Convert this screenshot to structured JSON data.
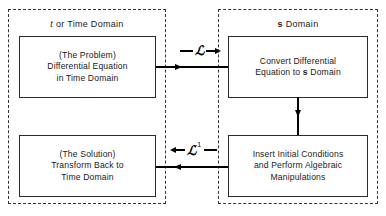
{
  "diagram": {
    "regions": [
      {
        "id": "time-domain",
        "label_prefix": "t",
        "label_rest": " or Time Domain"
      },
      {
        "id": "s-domain",
        "label_prefix": "s",
        "label_rest": " Domain"
      }
    ],
    "boxes": [
      {
        "id": "problem",
        "text": "(The Problem)\nDifferential Equation\nin Time Domain"
      },
      {
        "id": "convert",
        "line1": "Convert Differential",
        "line2_pre": "Equation to ",
        "line2_sym": "s",
        "line2_post": " Domain"
      },
      {
        "id": "solution",
        "text": "(The Solution)\nTransform Back to\nTime Domain"
      },
      {
        "id": "insert",
        "text": "Insert Initial Conditions\nand Perform Algebraic\nManipulations"
      }
    ],
    "operators": [
      {
        "id": "laplace-forward",
        "symbol": "ℒ",
        "superscript": "",
        "direction": "right"
      },
      {
        "id": "laplace-inverse",
        "symbol": "ℒ",
        "superscript": "-1",
        "direction": "left"
      }
    ],
    "connectors": [
      {
        "id": "forward-flow",
        "direction": "right"
      },
      {
        "id": "downward-flow",
        "direction": "down"
      },
      {
        "id": "return-flow",
        "direction": "left"
      }
    ],
    "colors": {
      "line": "#000000",
      "box_border": "#2a2a2a",
      "region_border": "#333333",
      "text": "#1a1a1a",
      "background": "#ffffff"
    }
  }
}
